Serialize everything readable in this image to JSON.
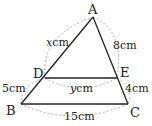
{
  "diagram": {
    "type": "triangle-with-parallel-segment",
    "points": {
      "A": {
        "label": "A",
        "x": 93,
        "y": 17
      },
      "B": {
        "label": "B",
        "x": 21,
        "y": 104
      },
      "C": {
        "label": "C",
        "x": 128,
        "y": 104
      },
      "D": {
        "label": "D",
        "x": 45,
        "y": 78
      },
      "E": {
        "label": "E",
        "x": 117,
        "y": 78
      }
    },
    "segments": [
      {
        "from": "A",
        "to": "B"
      },
      {
        "from": "A",
        "to": "C"
      },
      {
        "from": "B",
        "to": "C"
      },
      {
        "from": "D",
        "to": "E"
      }
    ],
    "measurements": {
      "AD": {
        "var": "x",
        "unit": "cm"
      },
      "DB": "5cm",
      "AE": "8cm",
      "EC": "4cm",
      "DE": {
        "var": "y",
        "unit": "cm"
      },
      "BC": "15cm"
    },
    "colors": {
      "line": "#222222",
      "dashed": "#999999",
      "text": "#222222"
    }
  }
}
